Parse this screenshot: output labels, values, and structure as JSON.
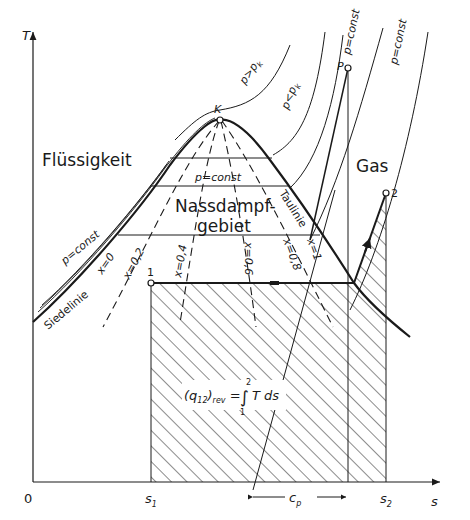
{
  "diagram": {
    "axes": {
      "y_label": "T",
      "x_label": "s",
      "origin_label": "0",
      "x_ticks": [
        {
          "label": "s",
          "sub": "1"
        },
        {
          "label": "s",
          "sub": "2"
        }
      ]
    },
    "regions": {
      "liquid": "Flüssigkeit",
      "wet_steam_line1": "Nassdampf-",
      "wet_steam_line2": "gebiet",
      "gas": "Gas"
    },
    "curves": {
      "boiling_line": "Siedelinie",
      "dew_line": "Taulinie",
      "critical_point": "K",
      "point_p": "P",
      "point_1": "1",
      "point_2": "2"
    },
    "isobars": {
      "above_critical": "p>p",
      "above_critical_sub": "k",
      "below_critical": "p<p",
      "below_critical_sub": "k",
      "const_inside": "p=const",
      "const_left": "p=const",
      "const_p": "p=const",
      "const_right": "p=const"
    },
    "quality_lines": [
      "x=0",
      "x=0,2",
      "x=0,4",
      "x=0,6",
      "x=0,8",
      "x=1"
    ],
    "formula": {
      "lhs": "(q",
      "lhs_sub": "12",
      "lhs_close": ")",
      "lhs_rev": "rev",
      "eq": " = ",
      "integral": "∫",
      "upper": "2",
      "lower": "1",
      "integrand": "T ds"
    },
    "dimension": {
      "label": "c",
      "sub": "p"
    },
    "colors": {
      "ink": "#1a1a1a",
      "background": "#ffffff"
    }
  }
}
